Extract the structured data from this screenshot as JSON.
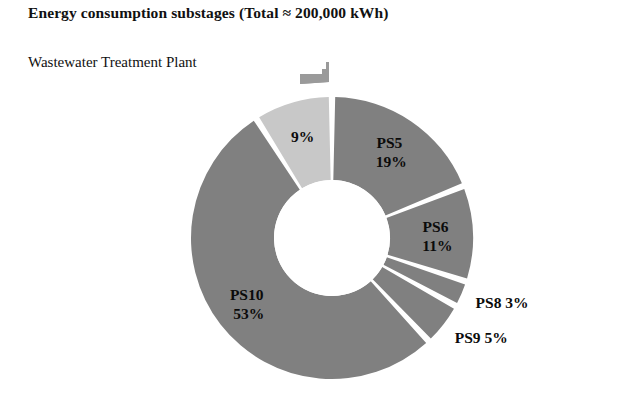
{
  "chart_title": "Energy consumption substages (Total ≈ 200,000 kWh)",
  "chart_subtitle": "Wastewater Treatment Plant",
  "colors": {
    "background": "#ffffff",
    "slice_dark_gray": "#808080",
    "slice_light_gray": "#c8c8c8",
    "label_text": "#0b0b0b",
    "gap": "#ffffff"
  },
  "chart_data": {
    "type": "pie",
    "variant": "donut",
    "title": "Energy consumption substages (Total ≈ 200,000 kWh)",
    "subtitle": "Wastewater Treatment Plant",
    "total_label": "Total ≈ 200,000 kWh",
    "total_value": 200000,
    "units": "kWh",
    "legend": "none",
    "grid": false,
    "labels_show_percent": true,
    "slices": [
      {
        "name": "PS5",
        "value": 19,
        "percent_label": "19%",
        "name_label": "PS5",
        "label_line1": "PS5",
        "label_line2": "19%",
        "color": "#808080",
        "label_position": "inside"
      },
      {
        "name": "PS6",
        "value": 11,
        "percent_label": "11%",
        "name_label": "PS6",
        "label_line1": "PS6",
        "label_line2": "11%",
        "color": "#808080",
        "label_position": "inside"
      },
      {
        "name": "PS8",
        "value": 3,
        "percent_label": "3%",
        "name_label": "PS8",
        "label_line1": "PS8 3%",
        "label_line2": "",
        "color": "#808080",
        "label_position": "outside"
      },
      {
        "name": "PS9",
        "value": 5,
        "percent_label": "5%",
        "name_label": "PS9",
        "label_line1": "PS9 5%",
        "label_line2": "",
        "color": "#808080",
        "label_position": "outside"
      },
      {
        "name": "PS10",
        "value": 53,
        "percent_label": "53%",
        "name_label": "PS10",
        "label_line1": "PS10",
        "label_line2": "53%",
        "color": "#808080",
        "label_position": "inside"
      },
      {
        "name": "",
        "value": 9,
        "percent_label": "9%",
        "name_label": "",
        "label_line1": "9%",
        "label_line2": "",
        "color": "#c8c8c8",
        "label_position": "inside"
      }
    ]
  }
}
